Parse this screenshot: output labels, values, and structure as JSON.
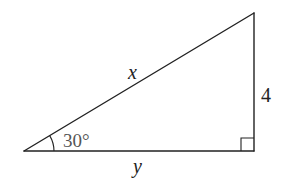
{
  "diagram": {
    "type": "right-triangle",
    "colors": {
      "line": "#222222",
      "angle_label": "#555555",
      "background": "#ffffff"
    },
    "vertices": {
      "left": [
        24,
        151
      ],
      "right_angle": [
        254,
        151
      ],
      "top": [
        254,
        13
      ]
    },
    "labels": {
      "hypotenuse": "x",
      "opposite_side": "4",
      "adjacent_side": "y",
      "angle": "30°"
    },
    "right_angle_marker": true
  }
}
